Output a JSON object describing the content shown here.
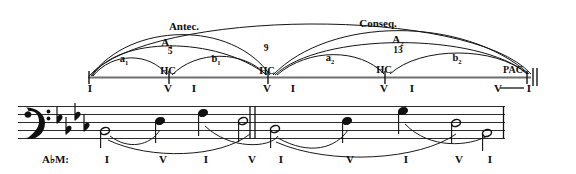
{
  "figure": {
    "type": "music-phrase-structure-diagram",
    "key": "A♭M:",
    "period_form": "double period",
    "ink_color": "#101010",
    "background_color": "#ffffff"
  },
  "diagram": {
    "sections": [
      {
        "label": "Antec.",
        "name": "antecedent",
        "x_center": 184,
        "y": 28,
        "span_start": 90,
        "span_end": 274
      },
      {
        "label": "Conseq.",
        "name": "consequent",
        "x_center": 378,
        "y": 25,
        "span_start": 274,
        "span_end": 520
      }
    ],
    "groups": [
      {
        "label": "A",
        "sub": "1",
        "x_center": 167,
        "y": 44
      },
      {
        "label": "A",
        "sub": "2",
        "x_center": 398,
        "y": 41
      }
    ],
    "phrases": [
      {
        "label": "a",
        "sub": "1",
        "x_center": 124,
        "y": 60
      },
      {
        "label": "b",
        "sub": "1",
        "x_center": 216,
        "y": 60
      },
      {
        "label": "a",
        "sub": "2",
        "x_center": 330,
        "y": 58
      },
      {
        "label": "b",
        "sub": "2",
        "x_center": 457,
        "y": 58
      }
    ],
    "measure_numbers": [
      {
        "label": "5",
        "x": 170,
        "y": 52
      },
      {
        "label": "9",
        "x": 266,
        "y": 48
      },
      {
        "label": "13",
        "x": 398,
        "y": 50
      }
    ],
    "cadences": [
      {
        "label": "HC",
        "name": "half-cadence",
        "x_center": 168,
        "y": 71
      },
      {
        "label": "HC",
        "name": "half-cadence",
        "x_center": 267,
        "y": 71
      },
      {
        "label": "HC",
        "name": "half-cadence",
        "x_center": 384,
        "y": 70
      },
      {
        "label": "PAC",
        "name": "perfect-authentic-cadence",
        "x_center": 513,
        "y": 70
      }
    ],
    "timeline": {
      "x_start": 88,
      "x_end": 530,
      "y": 78,
      "ticks": [
        88,
        169,
        245,
        268,
        337,
        385,
        412,
        503,
        527
      ],
      "final_double_barline_x": 534
    },
    "roman_numerals": [
      {
        "label": "I",
        "x": 90,
        "y": 86
      },
      {
        "label": "V",
        "x": 168,
        "y": 86
      },
      {
        "label": "I",
        "x": 194,
        "y": 86
      },
      {
        "label": "V",
        "x": 267,
        "y": 86
      },
      {
        "label": "I",
        "x": 293,
        "y": 86
      },
      {
        "label": "V",
        "x": 384,
        "y": 86
      },
      {
        "label": "I",
        "x": 412,
        "y": 86
      },
      {
        "label": "V",
        "x": 498,
        "y": 86
      },
      {
        "label": "I",
        "x": 529,
        "y": 86
      }
    ]
  },
  "score": {
    "clef": "bass-clef",
    "key_signature": {
      "accidental": "flat",
      "count": 4,
      "name": "A-flat-major"
    },
    "key_label": "A♭M:",
    "staff": {
      "x_start": 18,
      "x_end": 508,
      "y_top": 106,
      "line_gap": 8
    },
    "barlines": [
      {
        "type": "double",
        "x": 252
      },
      {
        "type": "final-thin",
        "x": 503
      }
    ],
    "notes": [
      {
        "pitch": "A♭3",
        "duration": "half",
        "x": 105,
        "y": 132,
        "stem": "down",
        "filled": false
      },
      {
        "pitch": "E♭4",
        "duration": "quarter",
        "x": 160,
        "y": 122,
        "stem": "down",
        "filled": true
      },
      {
        "pitch": "A♭4",
        "duration": "quarter",
        "x": 203,
        "y": 114,
        "stem": "down",
        "filled": true
      },
      {
        "pitch": "E♭4",
        "duration": "half",
        "x": 249,
        "y": 122,
        "stem": "down",
        "filled": false
      },
      {
        "pitch": "C4",
        "duration": "half",
        "x": 278,
        "y": 130,
        "stem": "down",
        "filled": false
      },
      {
        "pitch": "E♭4",
        "duration": "quarter",
        "x": 347,
        "y": 122,
        "stem": "down",
        "filled": true
      },
      {
        "pitch": "A♭4",
        "duration": "quarter",
        "x": 403,
        "y": 112,
        "stem": "down",
        "filled": true
      },
      {
        "pitch": "E♭4",
        "duration": "half",
        "x": 456,
        "y": 124,
        "stem": "down",
        "filled": false
      },
      {
        "pitch": "A♭3",
        "duration": "half",
        "x": 487,
        "y": 134,
        "stem": "down",
        "filled": false
      }
    ],
    "roman_numerals": [
      {
        "label": "I",
        "x": 107,
        "y": 160
      },
      {
        "label": "V",
        "x": 163,
        "y": 160
      },
      {
        "label": "I",
        "x": 206,
        "y": 160
      },
      {
        "label": "V",
        "x": 252,
        "y": 160
      },
      {
        "label": "I",
        "x": 281,
        "y": 160
      },
      {
        "label": "V",
        "x": 350,
        "y": 160
      },
      {
        "label": "I",
        "x": 406,
        "y": 160
      },
      {
        "label": "V",
        "x": 459,
        "y": 160
      },
      {
        "label": "I",
        "x": 490,
        "y": 160
      }
    ]
  }
}
